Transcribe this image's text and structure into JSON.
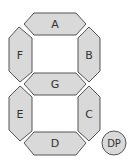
{
  "diagram": {
    "title": "",
    "segments": [
      {
        "id": "A",
        "label": "A"
      },
      {
        "id": "B",
        "label": "B"
      },
      {
        "id": "C",
        "label": "C"
      },
      {
        "id": "D",
        "label": "D"
      },
      {
        "id": "E",
        "label": "E"
      },
      {
        "id": "F",
        "label": "F"
      },
      {
        "id": "G",
        "label": "G"
      }
    ],
    "decimal_point": {
      "id": "DP",
      "label": "DP"
    },
    "colors": {
      "fill": "#d9d9d9",
      "stroke": "#555555",
      "text": "#333333"
    }
  }
}
